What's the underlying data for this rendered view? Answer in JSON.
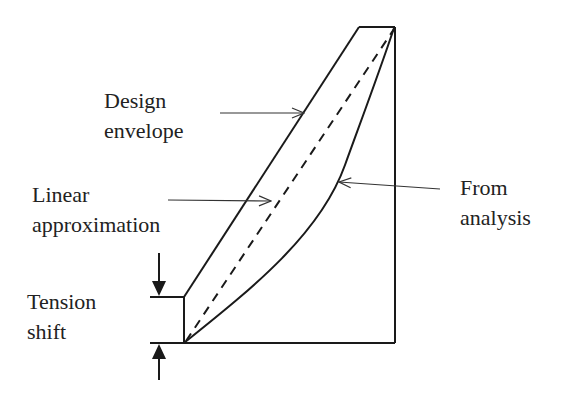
{
  "diagram": {
    "labels": {
      "design_envelope": [
        "Design",
        "envelope"
      ],
      "linear_approximation": [
        "Linear",
        "approximation"
      ],
      "from_analysis": [
        "From",
        "analysis"
      ],
      "tension_shift": [
        "Tension",
        "shift"
      ]
    },
    "colors": {
      "stroke": "#1a1a1a",
      "text": "#222222",
      "background": "#ffffff"
    }
  }
}
